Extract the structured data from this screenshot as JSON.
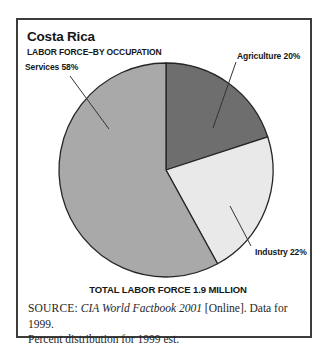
{
  "header": {
    "title": "Costa Rica",
    "subtitle": "LABOR FORCE–BY OCCUPATION"
  },
  "chart_data": {
    "type": "pie",
    "categories": [
      "Agriculture",
      "Industry",
      "Services"
    ],
    "values": [
      20,
      22,
      58
    ],
    "labels": {
      "agriculture": "Agriculture 20%",
      "industry": "Industry 22%",
      "services": "Services 58%"
    },
    "colors": [
      "#6e6e6e",
      "#e9e9e9",
      "#a9a9a9"
    ],
    "stroke_color": "#262626",
    "start_angle_deg": 0,
    "direction": "clockwise",
    "total_note": "TOTAL LABOR FORCE 1.9 MILLION"
  },
  "source": {
    "label": "SOURCE:",
    "work_italic": "CIA World Factbook 2001",
    "after_italic": "[Online]. Data for 1999.",
    "line2": "Percent distribution for 1999 est."
  }
}
